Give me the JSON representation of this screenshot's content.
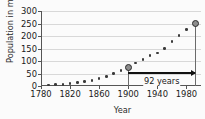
{
  "chart_data": {
    "type": "scatter",
    "title": "",
    "xlabel": "Year",
    "ylabel": "Population in millions",
    "xlim": [
      1780,
      2000
    ],
    "ylim": [
      0,
      300
    ],
    "xticks": [
      1780,
      1820,
      1860,
      1900,
      1940,
      1980
    ],
    "yticks": [
      0,
      50,
      100,
      150,
      200,
      250,
      300
    ],
    "grid": true,
    "legend": null,
    "x": [
      1790,
      1800,
      1810,
      1820,
      1830,
      1840,
      1850,
      1860,
      1870,
      1880,
      1890,
      1900,
      1910,
      1920,
      1930,
      1940,
      1950,
      1960,
      1970,
      1980,
      1992
    ],
    "values": [
      4,
      5,
      7,
      10,
      13,
      17,
      23,
      31,
      39,
      50,
      63,
      76,
      92,
      106,
      123,
      132,
      151,
      179,
      203,
      227,
      250
    ],
    "highlighted_points": [
      {
        "x": 1900,
        "y": 76
      },
      {
        "x": 1992,
        "y": 250
      }
    ],
    "annotations": [
      {
        "text": "92 years",
        "from_x": 1900,
        "to_x": 1992,
        "at_y": 55
      }
    ]
  },
  "axes": {
    "y_title": "Population in millions",
    "x_title": "Year",
    "y_tick_labels": [
      "0",
      "50",
      "100",
      "150",
      "200",
      "250",
      "300"
    ],
    "x_tick_labels": [
      "1780",
      "1820",
      "1860",
      "1900",
      "1940",
      "1980"
    ]
  },
  "annotation": {
    "span_label": "92 years"
  },
  "colors": {
    "background": "#fbfbfb",
    "axis": "#555555",
    "gridline": "#d8d8d8",
    "marker": "#3a3a3a",
    "highlight_fill": "#8d8d8d",
    "highlight_stroke": "#2b2b2b",
    "annotation": "#111111",
    "text": "#1a1a1a"
  }
}
